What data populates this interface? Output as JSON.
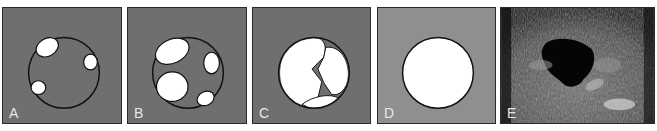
{
  "figure": {
    "panels": [
      {
        "label": "A",
        "description": "Circle with three small white cystic spaces at the periphery",
        "background": "#6f6f6f"
      },
      {
        "label": "B",
        "description": "Circle with four larger white cystic spaces",
        "background": "#6f6f6f"
      },
      {
        "label": "C",
        "description": "Circle nearly filled by coalescing white spaces with small gray septa",
        "background": "#6f6f6f"
      },
      {
        "label": "D",
        "description": "Circle completely white (single large cyst)",
        "background": "#8f8f8f"
      },
      {
        "label": "E",
        "description": "Grayscale ultrasound image with a dark anechoic region",
        "background": "#1c1c1c"
      }
    ]
  }
}
